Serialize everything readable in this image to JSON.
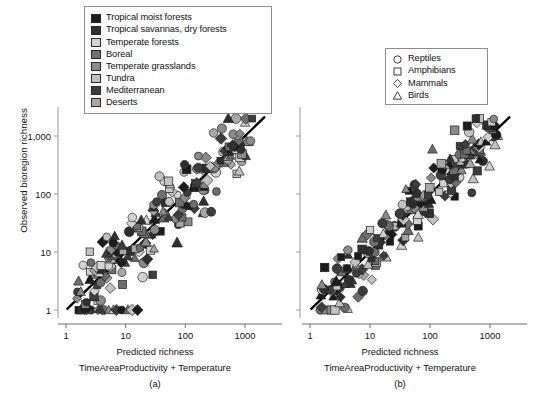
{
  "figure": {
    "width": 540,
    "height": 399,
    "background": "#ffffff"
  },
  "axis_titles": {
    "y": "Observed bioregion richness",
    "x": "Predicted richness",
    "x_sub": "TimeAreaProductivity + Temperature"
  },
  "biome_legend": {
    "name": "biome-legend",
    "items": [
      {
        "label": "Tropical moist forests",
        "color": "#1c1c1c"
      },
      {
        "label": "Tropical savannas, dry forests",
        "color": "#2f2f2f"
      },
      {
        "label": "Temperate forests",
        "color": "#d2d2d2"
      },
      {
        "label": "Boreal",
        "color": "#6e6e6e"
      },
      {
        "label": "Temperate grasslands",
        "color": "#8a8a8a"
      },
      {
        "label": "Tundra",
        "color": "#c2c2c2"
      },
      {
        "label": "Mediterranean",
        "color": "#3d3d3d"
      },
      {
        "label": "Deserts",
        "color": "#a8a8a8"
      }
    ]
  },
  "taxon_legend": {
    "name": "taxon-legend",
    "items": [
      {
        "label": "Reptiles",
        "shape": "circle"
      },
      {
        "label": "Amphibians",
        "shape": "square"
      },
      {
        "label": "Mammals",
        "shape": "diamond"
      },
      {
        "label": "Birds",
        "shape": "triangle"
      }
    ]
  },
  "chart_data": {
    "type": "scatter",
    "title": "",
    "xlabel": "Predicted richness",
    "ylabel": "Observed bioregion richness",
    "xscale": "log",
    "yscale": "log",
    "xlim": [
      1,
      3000
    ],
    "ylim": [
      1,
      3000
    ],
    "xticks": [
      1,
      10,
      100,
      1000
    ],
    "xtick_labels": [
      "1",
      "10",
      "100",
      "1000"
    ],
    "yticks": [
      1,
      10,
      100,
      1000
    ],
    "ytick_labels": [
      "1",
      "10",
      "100",
      "1,000"
    ],
    "grid": false,
    "legend_position": "top-left",
    "reference_line": {
      "type": "identity",
      "label": "1:1 line",
      "color": "#000000",
      "width": 2.4
    },
    "panels": [
      {
        "id": "a",
        "caption": "(a)",
        "subtitle": "TimeAreaProductivity + Temperature",
        "n_points": 190,
        "seed": 7321,
        "spread": 0.3,
        "floor_count": 13,
        "notes": "Observed vs predicted richness, points scattered about the 1:1 line"
      },
      {
        "id": "b",
        "caption": "(b)",
        "subtitle": "TimeAreaProductivity + Temperature",
        "n_points": 190,
        "seed": 4517,
        "spread": 0.28,
        "floor_count": 4,
        "notes": "Observed vs predicted richness, points scattered about the 1:1 line"
      }
    ],
    "series": [
      {
        "name": "Reptiles",
        "shape": "circle"
      },
      {
        "name": "Amphibians",
        "shape": "square"
      },
      {
        "name": "Mammals",
        "shape": "diamond"
      },
      {
        "name": "Birds",
        "shape": "triangle"
      }
    ],
    "group_colors": [
      "#1c1c1c",
      "#2f2f2f",
      "#d2d2d2",
      "#6e6e6e",
      "#8a8a8a",
      "#c2c2c2",
      "#3d3d3d",
      "#a8a8a8"
    ]
  },
  "panel_a": {
    "caption": "(a)",
    "x_title": "Predicted richness",
    "x_sub": "TimeAreaProductivity + Temperature",
    "tick_labels": [
      "1",
      "10",
      "100",
      "1000"
    ]
  },
  "panel_b": {
    "caption": "(b)",
    "x_title": "Predicted richness",
    "x_sub": "TimeAreaProductivity + Temperature",
    "tick_labels": [
      "1",
      "10",
      "100",
      "1000"
    ]
  }
}
